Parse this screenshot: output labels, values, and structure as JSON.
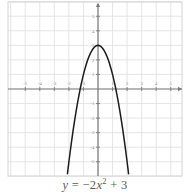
{
  "figure": {
    "caption_lhs": "y",
    "caption_eq": " = ",
    "caption_coef": "−2",
    "caption_var": "x",
    "caption_exp": "2",
    "caption_tail": " + 3",
    "caption_full": "y = −2x² + 3"
  },
  "style": {
    "grid_color": "#e2e2e4",
    "axis_color": "#7a7a7c",
    "curve_color": "#1c1c1c",
    "label_color": "#8a8a8c",
    "frame_color": "#d8d8da",
    "background": "#ffffff"
  },
  "chart_data": {
    "type": "line",
    "title": "",
    "subtitle": "",
    "xlabel": "x",
    "ylabel": "y",
    "equation": "y = -2x^2 + 3",
    "grid": true,
    "legend": "none",
    "xlim": [
      -6.1,
      6.2
    ],
    "ylim": [
      -6.1,
      6.0
    ],
    "xticks": [
      -5,
      -4,
      -3,
      -2,
      -1,
      1,
      2,
      3,
      4,
      5
    ],
    "xtick_labels": [
      "-5",
      "-4",
      "-3",
      "-2",
      "-1",
      "1",
      "2",
      "3",
      "4",
      "5"
    ],
    "yticks": [
      -5,
      -4,
      -3,
      -2,
      -1,
      1,
      2,
      3,
      4,
      5
    ],
    "ytick_labels": [
      "-5",
      "-4",
      "-3",
      "-2",
      "-1",
      "1",
      "2",
      "3",
      "4",
      "5"
    ],
    "x_axis_arrow": true,
    "y_axis_arrow": true,
    "vertex": [
      0,
      3
    ],
    "roots": [
      -1.2247,
      1.2247
    ],
    "y_intercept": 3,
    "series": [
      {
        "name": "y = -2x^2 + 3",
        "x": [
          -2.1,
          -2.0,
          -1.9,
          -1.8,
          -1.7,
          -1.6,
          -1.5,
          -1.4,
          -1.3,
          -1.2,
          -1.1,
          -1.0,
          -0.9,
          -0.8,
          -0.7,
          -0.6,
          -0.5,
          -0.4,
          -0.3,
          -0.2,
          -0.1,
          0,
          0.1,
          0.2,
          0.3,
          0.4,
          0.5,
          0.6,
          0.7,
          0.8,
          0.9,
          1.0,
          1.1,
          1.2,
          1.3,
          1.4,
          1.5,
          1.6,
          1.7,
          1.8,
          1.9,
          2.0,
          2.1
        ],
        "y": [
          -5.82,
          -5.0,
          -4.22,
          -3.48,
          -2.78,
          -2.12,
          -1.5,
          -0.92,
          -0.38,
          0.12,
          0.58,
          1.0,
          1.38,
          1.72,
          2.02,
          2.28,
          2.5,
          2.68,
          2.82,
          2.92,
          2.98,
          3.0,
          2.98,
          2.92,
          2.82,
          2.68,
          2.5,
          2.28,
          2.02,
          1.72,
          1.38,
          1.0,
          0.58,
          0.12,
          -0.38,
          -0.92,
          -1.5,
          -2.12,
          -2.78,
          -3.48,
          -4.22,
          -5.0,
          -5.82
        ]
      }
    ]
  }
}
